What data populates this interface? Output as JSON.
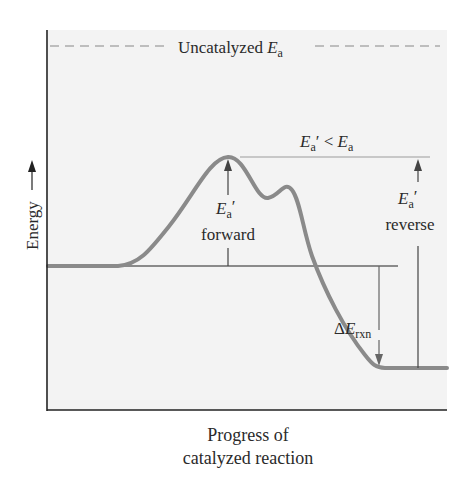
{
  "diagram": {
    "type": "energy_profile",
    "y_axis_label": "Energy",
    "x_axis_label_line1": "Progress of",
    "x_axis_label_line2": "catalyzed reaction",
    "uncatalyzed": {
      "text": "Uncatalyzed ",
      "symbol": "E",
      "subscript": "a"
    },
    "comparison": {
      "left_symbol": "E",
      "left_sub": "a",
      "prime": "′",
      "operator": " < ",
      "right_symbol": "E",
      "right_sub": "a"
    },
    "forward": {
      "symbol": "E",
      "subscript": "a",
      "prime": "′",
      "label": "forward"
    },
    "reverse": {
      "symbol": "E",
      "subscript": "a",
      "prime": "′",
      "label": "reverse"
    },
    "delta": {
      "prefix": "Δ",
      "symbol": "E",
      "subscript": "rxn"
    },
    "colors": {
      "curve": "#8a8a8a",
      "plot_background": "#f3f3f3",
      "axis": "#222222",
      "dashed_line": "#bdbdbd",
      "guide_line": "#b8b8b8"
    }
  }
}
